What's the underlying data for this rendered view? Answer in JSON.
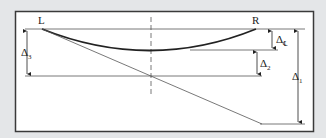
{
  "diagram": {
    "type": "beam-deflection-diagram",
    "colors": {
      "background": "#e4e6e8",
      "panel": "#ffffff",
      "frame": "#3a3a3a",
      "line": "#555555",
      "curve": "#222222"
    },
    "points": {
      "left_support": "L",
      "right_support": "R"
    },
    "dimensions": {
      "delta_1": {
        "symbol": "Δ",
        "subscript": "1"
      },
      "delta_2": {
        "symbol": "Δ",
        "subscript": "2"
      },
      "delta_3": {
        "symbol": "Δ",
        "subscript": "3"
      },
      "delta_c": {
        "symbol": "Δ",
        "subscript": "℄"
      }
    }
  }
}
